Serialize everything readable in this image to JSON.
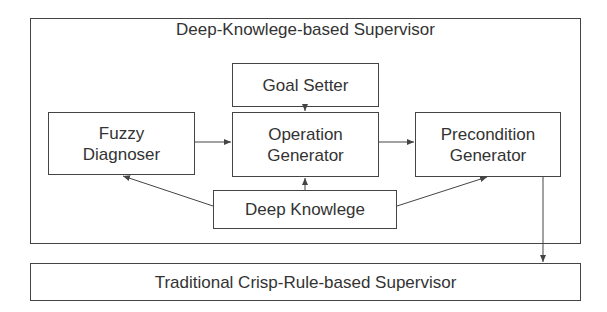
{
  "diagram": {
    "container": {
      "title": "Deep-Knowlege-based Supervisor"
    },
    "nodes": {
      "goal_setter": "Goal Setter",
      "fuzzy_diagnoser": {
        "line1": "Fuzzy",
        "line2": "Diagnoser"
      },
      "operation_generator": {
        "line1": "Operation",
        "line2": "Generator"
      },
      "precondition_generator": {
        "line1": "Precondition",
        "line2": "Generator"
      },
      "deep_knowledge": "Deep Knowlege",
      "traditional_supervisor": "Traditional Crisp-Rule-based Supervisor"
    },
    "edges": [
      {
        "from": "Goal Setter",
        "to": "Operation Generator"
      },
      {
        "from": "Fuzzy Diagnoser",
        "to": "Operation Generator"
      },
      {
        "from": "Operation Generator",
        "to": "Precondition Generator"
      },
      {
        "from": "Deep Knowlege",
        "to": "Fuzzy Diagnoser"
      },
      {
        "from": "Deep Knowlege",
        "to": "Operation Generator"
      },
      {
        "from": "Deep Knowlege",
        "to": "Precondition Generator"
      },
      {
        "from": "Precondition Generator",
        "to": "Traditional Crisp-Rule-based Supervisor"
      }
    ]
  }
}
